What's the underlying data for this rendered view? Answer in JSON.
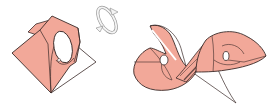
{
  "diagram": {
    "type": "origami-folding-steps",
    "colors": {
      "paper_front": "#f2a899",
      "paper_back": "#ffffff",
      "outline": "#3a2a28",
      "arrow_fill": "#f0f0f0",
      "arrow_stroke": "#888888"
    },
    "figures": [
      {
        "name": "step-left",
        "description": "folded square with oval hole"
      },
      {
        "name": "turn-over-arrow",
        "description": "rotate / turn over symbol"
      },
      {
        "name": "step-right",
        "description": "double spiral result"
      }
    ]
  }
}
